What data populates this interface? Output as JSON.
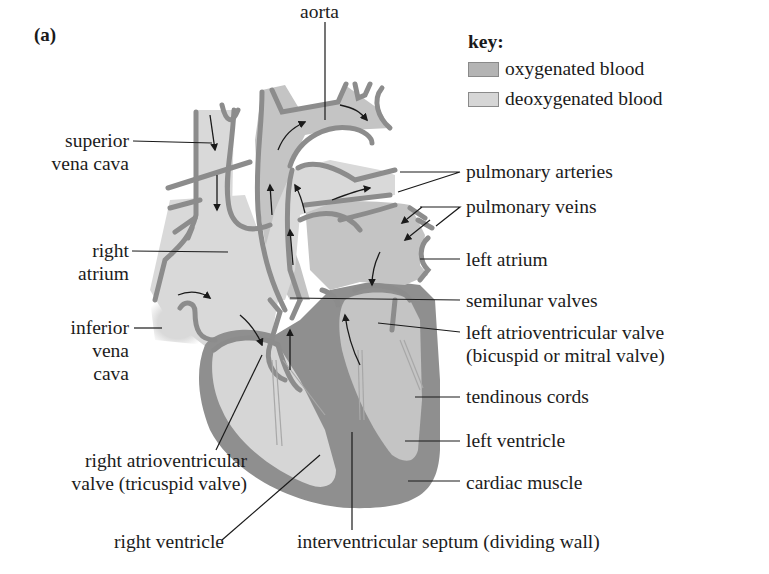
{
  "figure": {
    "panel_label": "(a)"
  },
  "key": {
    "title": "key:",
    "items": [
      {
        "label": "oxygenated blood",
        "color": "#b4b4b4"
      },
      {
        "label": "deoxygenated blood",
        "color": "#d6d6d6"
      }
    ]
  },
  "colors": {
    "vessel_wall": "#8c8c8c",
    "muscle": "#8f8f8f",
    "oxygenated": "#c4c4c4",
    "deoxygenated": "#d9d9d9",
    "leader_line": "#1a1a1a"
  },
  "labels": {
    "left": {
      "superior_vena_cava": [
        "superior",
        "vena cava"
      ],
      "right_atrium": [
        "right",
        "atrium"
      ],
      "inferior_vena_cava": [
        "inferior",
        "vena",
        "cava"
      ],
      "right_av_valve": [
        "right atrioventricular",
        "valve (tricuspid valve)"
      ],
      "right_ventricle": "right ventricle"
    },
    "top": {
      "aorta": "aorta"
    },
    "right": {
      "pulmonary_arteries": "pulmonary arteries",
      "pulmonary_veins": "pulmonary veins",
      "left_atrium": "left atrium",
      "semilunar_valves": "semilunar valves",
      "left_av_valve": [
        "left atrioventricular valve",
        "(bicuspid or mitral valve)"
      ],
      "tendinous_cords": "tendinous cords",
      "left_ventricle": "left ventricle",
      "cardiac_muscle": "cardiac muscle"
    },
    "bottom": {
      "interventricular_septum": "interventricular septum (dividing wall)"
    }
  }
}
